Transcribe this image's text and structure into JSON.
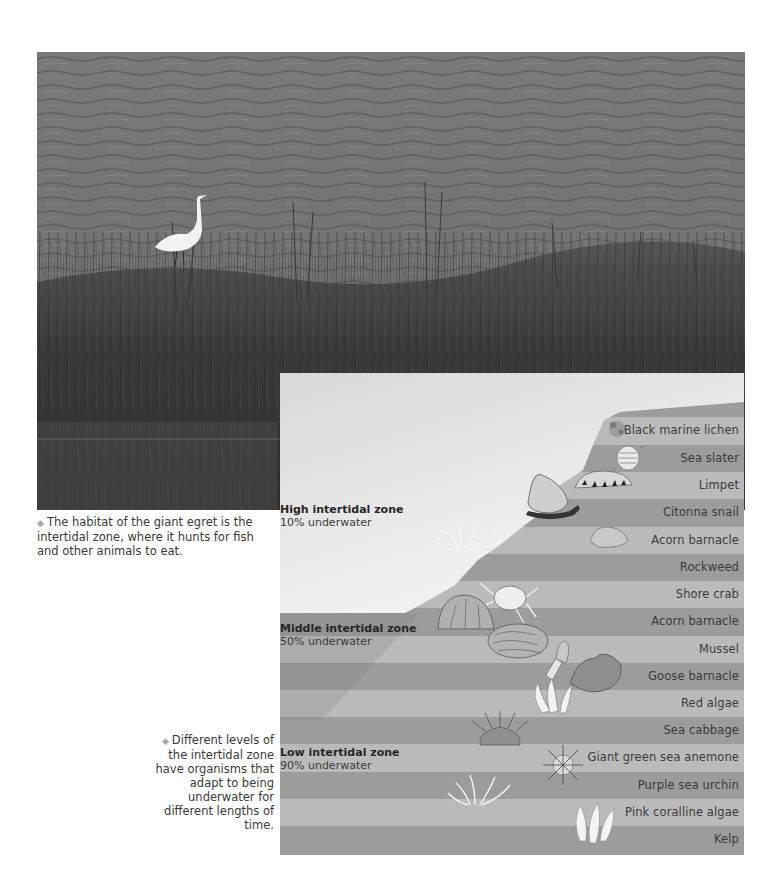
{
  "photo": {
    "subject": "giant egret wading among marsh grass beside water",
    "colors": {
      "water": "#6e6e6e",
      "grass": "#3c3c3c",
      "egret": "#f2f2f2"
    }
  },
  "captions": {
    "photo_caption": "The habitat of the giant egret is the intertidal zone, where it hunts for fish and other animals to eat.",
    "diagram_caption": "Different levels of the intertidal zone have organisms that adapt to being underwater for different lengths of time.",
    "bullet_icon": "◆"
  },
  "diagram": {
    "colors": {
      "dark_stripe": "#9b9b9b",
      "light_stripe": "#b9b9b9",
      "sky_top": "#dcdcdc",
      "sky_bottom": "#ffffff",
      "middle_overlay": "#8f8f8f"
    },
    "zones": [
      {
        "name": "High intertidal zone",
        "percent": "10% underwater"
      },
      {
        "name": "Middle intertidal zone",
        "percent": "50% underwater"
      },
      {
        "name": "Low intertidal zone",
        "percent": "90% underwater"
      }
    ],
    "organisms": [
      {
        "label": "Black marine lichen",
        "icon": "lichen-icon"
      },
      {
        "label": "Sea slater",
        "icon": "sea-slater-icon"
      },
      {
        "label": "Limpet",
        "icon": "limpet-icon"
      },
      {
        "label": "Citonna snail",
        "icon": "snail-icon"
      },
      {
        "label": "Acorn barnacle",
        "icon": "acorn-barnacle-icon"
      },
      {
        "label": "Rockweed",
        "icon": "rockweed-icon"
      },
      {
        "label": "Shore crab",
        "icon": "crab-icon"
      },
      {
        "label": "Acorn barnacle",
        "icon": "acorn-barnacle-icon"
      },
      {
        "label": "Mussel",
        "icon": "mussel-icon"
      },
      {
        "label": "Goose barnacle",
        "icon": "goose-barnacle-icon"
      },
      {
        "label": "Red algae",
        "icon": "red-algae-icon"
      },
      {
        "label": "Sea cabbage",
        "icon": "sea-cabbage-icon"
      },
      {
        "label": "Giant green sea anemone",
        "icon": "anemone-icon"
      },
      {
        "label": "Purple sea urchin",
        "icon": "urchin-icon"
      },
      {
        "label": "Pink coralline algae",
        "icon": "coralline-algae-icon"
      },
      {
        "label": "Kelp",
        "icon": "kelp-icon"
      }
    ]
  }
}
